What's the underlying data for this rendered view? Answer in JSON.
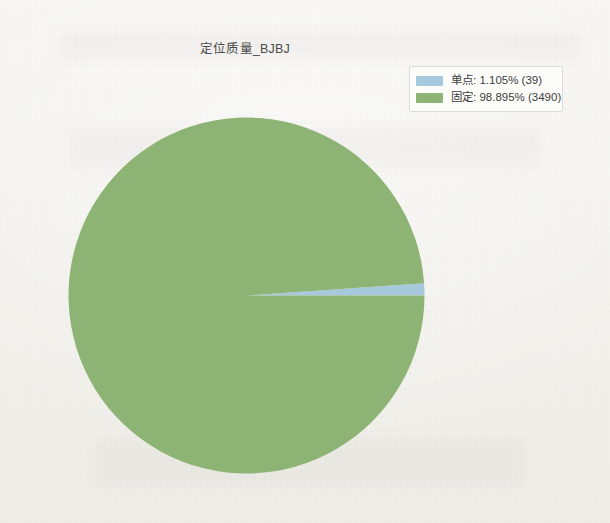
{
  "chart_data": {
    "type": "pie",
    "title": "定位质量_BJBJ",
    "categories": [
      "单点",
      "固定"
    ],
    "values": [
      39,
      3490
    ],
    "percentages": [
      1.105,
      98.895
    ],
    "labels": [
      "单点: 1.105% (39)",
      "固定: 98.895% (3490)"
    ],
    "colors": [
      "#a6c9dd",
      "#8db474"
    ],
    "legend_position": "top-right",
    "grid": false,
    "xlabel": "",
    "ylabel": "",
    "start_angle_deg": 0,
    "direction": "counterclockwise",
    "total": 3529
  },
  "legend": {
    "entries": [
      {
        "name": "单点",
        "label": "单点: 1.105% (39)",
        "color": "#a6c9dd",
        "percent": "1.105%",
        "count": "39"
      },
      {
        "name": "固定",
        "label": "固定: 98.895% (3490)",
        "color": "#8db474",
        "percent": "98.895%",
        "count": "3490"
      }
    ]
  },
  "slices": [
    {
      "name": "单点",
      "path": "M 178.5 178.5 L 356.5 178.5 A 178 178 0 0 0 355.4 165.2 Z",
      "color": "#a6c9dd"
    },
    {
      "name": "固定",
      "path": "M 178.5 178.5 L 355.4 165.2 A 178 178 0 1 0 356.5 178.5 Z",
      "color": "#8db474"
    }
  ]
}
